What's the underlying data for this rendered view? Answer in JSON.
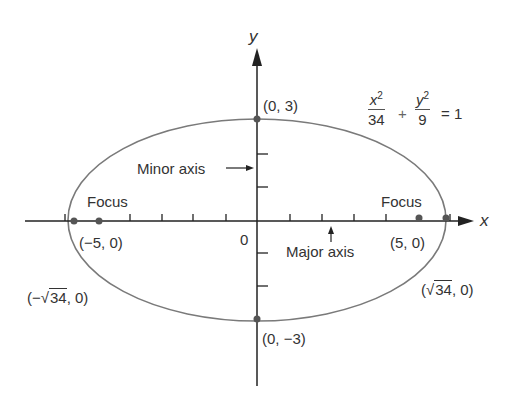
{
  "axes": {
    "x_label": "x",
    "y_label": "y",
    "origin_label": "0"
  },
  "equation": {
    "term1": {
      "num_var": "x",
      "num_exp": "2",
      "den": "34"
    },
    "plus": "+",
    "term2": {
      "num_var": "y",
      "num_exp": "2",
      "den": "9"
    },
    "rhs": "= 1"
  },
  "points": {
    "top_vertex": "(0, 3)",
    "bottom_vertex": "(0, −3)",
    "left_focus": "(−5, 0)",
    "right_focus": "(5, 0)",
    "left_vertex_prefix": "(−√",
    "left_vertex_rad": "34",
    "left_vertex_suffix": ", 0)",
    "right_vertex_prefix": "(√",
    "right_vertex_rad": "34",
    "right_vertex_suffix": ", 0)"
  },
  "annotations": {
    "minor_axis": "Minor axis",
    "major_axis": "Major axis",
    "focus_left": "Focus",
    "focus_right": "Focus"
  },
  "colors": {
    "curve": "#777777",
    "axis": "#222222",
    "point": "#555555"
  }
}
